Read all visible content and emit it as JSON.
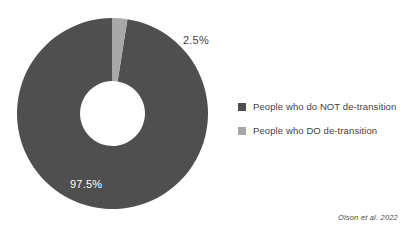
{
  "chart_data": {
    "type": "pie",
    "variant": "donut",
    "title": "",
    "subtitle": "",
    "xlabel": "",
    "ylabel": "",
    "legend_position": "right",
    "grid": false,
    "inner_radius_ratio": 0.34,
    "start_angle_deg": 0,
    "direction": "clockwise",
    "categories": [
      "People who do NOT de-transition",
      "People who DO de-transition"
    ],
    "values": [
      97.5,
      2.5
    ],
    "value_labels": [
      "97.5%",
      "2.5%"
    ],
    "colors": [
      "#4f4f4f",
      "#a8a8a8"
    ],
    "slices": [
      {
        "label": "People who do NOT de-transition",
        "value": 97.5,
        "value_label": "97.5%",
        "color": "#4f4f4f",
        "label_color": "#ffffff",
        "start_deg": 9,
        "sweep_deg": 351
      },
      {
        "label": "People who DO de-transition",
        "value": 2.5,
        "value_label": "2.5%",
        "color": "#a8a8a8",
        "label_color": "#3f3f3f",
        "start_deg": 0,
        "sweep_deg": 9
      }
    ],
    "annotations": [
      "Olson et al. 2022"
    ]
  },
  "legend": {
    "items": [
      {
        "label": "People who do NOT de-transition",
        "color": "#4f4f4f"
      },
      {
        "label": "People who DO de-transition",
        "color": "#a8a8a8"
      }
    ]
  },
  "labels": {
    "major": "97.5%",
    "minor": "2.5%"
  },
  "attribution": {
    "text": "Olson et al. 2022"
  },
  "colors": {
    "background": "#ffffff",
    "slice_major": "#4f4f4f",
    "slice_minor": "#a8a8a8",
    "text": "#3f3f3f",
    "label_on_dark": "#ffffff"
  }
}
